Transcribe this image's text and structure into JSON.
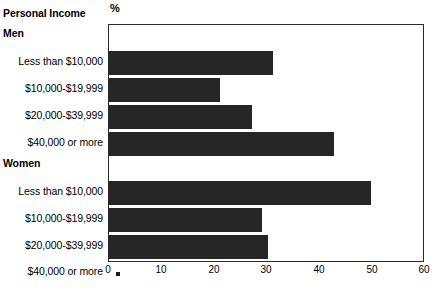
{
  "chart_data": {
    "type": "bar",
    "orientation": "horizontal",
    "title": "",
    "xlabel": "%",
    "ylabel": "Personal Income",
    "xlim": [
      0,
      60
    ],
    "xticks": [
      0,
      10,
      20,
      30,
      40,
      50,
      60
    ],
    "xtick_labels": [
      "0",
      "10",
      "20",
      "30",
      "40",
      "50",
      "60"
    ],
    "grid": false,
    "legend": "none",
    "bar_color": "#262626",
    "groups": [
      {
        "name": "Men",
        "categories": [
          "Less than $10,000",
          "$10,000-$19,999",
          "$20,000-$39,999",
          "$40,000 or more"
        ],
        "values": [
          31.3,
          21.3,
          27.3,
          43.0
        ],
        "suppressed": [
          false,
          false,
          false,
          false
        ]
      },
      {
        "name": "Women",
        "categories": [
          "Less than $10,000",
          "$10,000-$19,999",
          "$20,000-$39,999",
          "$40,000 or more"
        ],
        "values": [
          50.0,
          29.2,
          30.4,
          null
        ],
        "suppressed": [
          false,
          false,
          false,
          true
        ]
      }
    ],
    "suppressed_symbol": "*"
  },
  "axis": {
    "percent_symbol": "%"
  },
  "labels": {
    "title": "Personal Income",
    "men_heading": "Men",
    "women_heading": "Women",
    "men_rows": [
      "Less than $10,000",
      "$10,000-$19,999",
      "$20,000-$39,999",
      "$40,000 or more"
    ],
    "women_rows": [
      "Less than $10,000",
      "$10,000-$19,999",
      "$20,000-$39,999",
      "$40,000 or more"
    ]
  },
  "ticks": {
    "t0": "0",
    "t1": "10",
    "t2": "20",
    "t3": "30",
    "t4": "40",
    "t5": "50",
    "t6": "60"
  }
}
